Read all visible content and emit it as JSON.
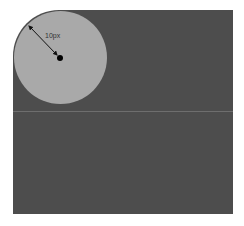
{
  "diagram": {
    "radius_label": "10px",
    "colors": {
      "background": "#ffffff",
      "panel": "#4d4d4d",
      "circle": "#a9a9a9",
      "divider": "#6e6e6e",
      "arrow": "#111111"
    }
  }
}
